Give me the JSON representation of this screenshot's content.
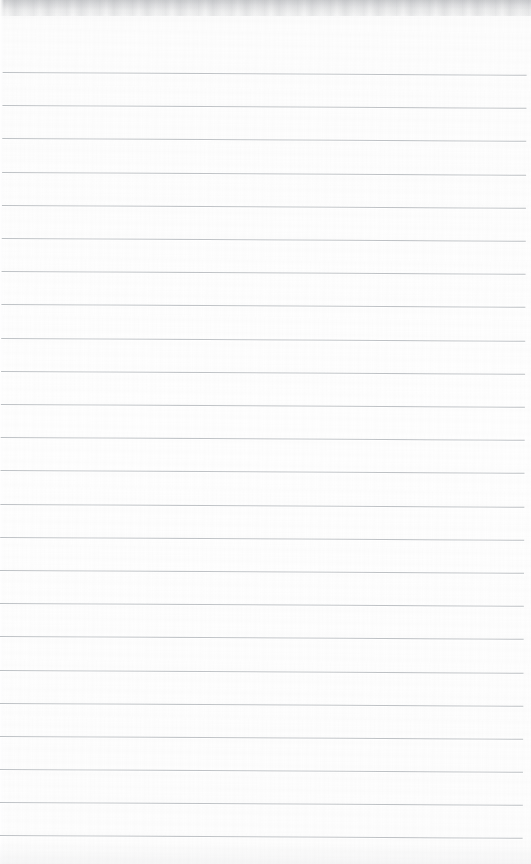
{
  "document": {
    "kind": "scanned-blank-ruled-paper",
    "title": "",
    "page_width": 531,
    "page_height": 864,
    "text_content": "",
    "is_blank": true
  },
  "paper": {
    "background_color": "#fdfdfd",
    "top_shadow_color": "#7d8186",
    "edge_highlight_color": "#ffffff"
  },
  "rules": {
    "line_color": "#b6babe",
    "line_thickness_px": 1,
    "line_count": 24,
    "first_line_y": 72,
    "line_spacing_px": 33.2,
    "line_left_x": 3,
    "line_right_x": 527,
    "skew_degrees": 0.3,
    "positions_y": [
      72,
      105,
      138,
      172,
      205,
      238,
      271,
      304,
      338,
      371,
      404,
      437,
      470,
      504,
      537,
      570,
      603,
      636,
      670,
      703,
      736,
      769,
      802,
      835
    ],
    "row_values": [
      "",
      "",
      "",
      "",
      "",
      "",
      "",
      "",
      "",
      "",
      "",
      "",
      "",
      "",
      "",
      "",
      "",
      "",
      "",
      "",
      "",
      "",
      "",
      ""
    ]
  }
}
